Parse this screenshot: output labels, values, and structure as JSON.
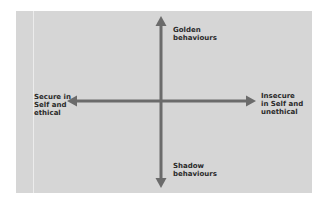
{
  "diagram": {
    "type": "quadrant-axes",
    "colors": {
      "background": "#d6d6d6",
      "arrow": "#6b6b6b",
      "text": "#2a2a2a"
    },
    "labels": {
      "top": [
        "Golden",
        "behaviours"
      ],
      "bottom": [
        "Shadow",
        "behaviours"
      ],
      "left": [
        "Secure in",
        "Self and",
        "ethical"
      ],
      "right": [
        "Insecure",
        "in Self and",
        "unethical"
      ]
    }
  }
}
